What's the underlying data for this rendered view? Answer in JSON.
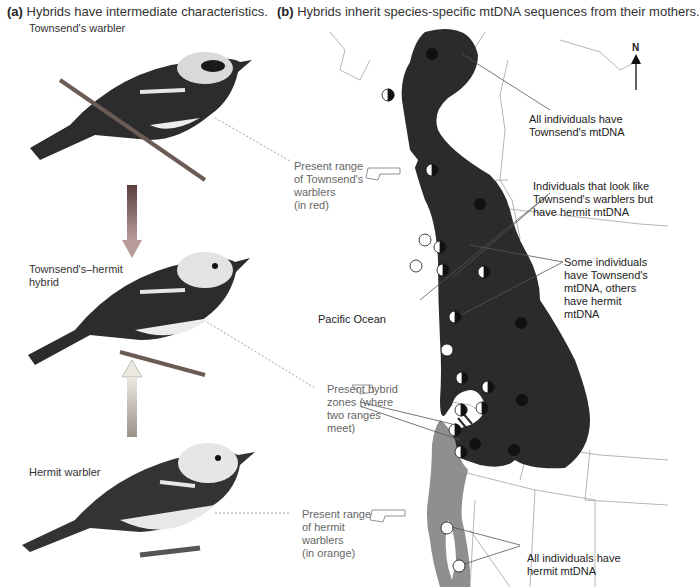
{
  "panel_a": {
    "letter": "(a)",
    "title": "Hybrids have intermediate characteristics.",
    "birds": [
      {
        "label": "Townsend's warbler"
      },
      {
        "label_line1": "Townsend's–hermit",
        "label_line2": "hybrid"
      },
      {
        "label": "Hermit warbler"
      }
    ],
    "arrow_colors": {
      "townsend": "#8a6a6a",
      "hermit": "#c9c3bb"
    }
  },
  "panel_b": {
    "letter": "(b)",
    "title": "Hybrids inherit species-specific mtDNA sequences from their mothers.",
    "compass": "N",
    "ocean_label": "Pacific Ocean",
    "callouts_left": [
      {
        "line1": "Present range",
        "line2": "of Townsend's",
        "line3": "warblers",
        "line4": "(in red)"
      },
      {
        "line1": "Present hybrid",
        "line2": "zones (where",
        "line3": "two ranges",
        "line4": "meet)"
      },
      {
        "line1": "Present range",
        "line2": "of hermit",
        "line3": "warblers",
        "line4": "(in orange)"
      }
    ],
    "annotations": [
      {
        "line1": "All individuals have",
        "line2": "Townsend's mtDNA"
      },
      {
        "line1": "Individuals that look like",
        "line2": "Townsend's warblers but",
        "line3": "have hermit mtDNA"
      },
      {
        "line1": "Some individuals",
        "line2": "have Townsend's",
        "line3": "mtDNA, others",
        "line4": "have hermit",
        "line5": "mtDNA"
      },
      {
        "line1": "All individuals have",
        "line2": "hermit mtDNA"
      }
    ],
    "colors": {
      "townsend_range": "#2b2b2b",
      "hermit_range": "#8f8f8f",
      "townsend_mtdna": "#111111",
      "hermit_mtdna": "#ffffff",
      "borders": "#aaaaaa"
    }
  }
}
